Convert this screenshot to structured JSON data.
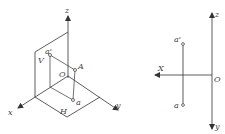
{
  "colors": {
    "line": "#333333",
    "label": "#444444",
    "background": "#ffffff"
  },
  "left_figure": {
    "description": "3D pictorial view of projection planes",
    "axes": {
      "z": "z",
      "x": "x",
      "y": "y",
      "origin": "O"
    },
    "planes": {
      "vertical": "V",
      "horizontal": "H"
    },
    "points": {
      "space_point": "A",
      "v_projection": "a'",
      "h_projection": "a"
    }
  },
  "right_figure": {
    "description": "Orthographic projection diagram",
    "axes": {
      "z": "z",
      "x": "X",
      "y": "y",
      "origin": "O"
    },
    "points": {
      "v_projection": "a'",
      "h_projection": "a"
    }
  }
}
